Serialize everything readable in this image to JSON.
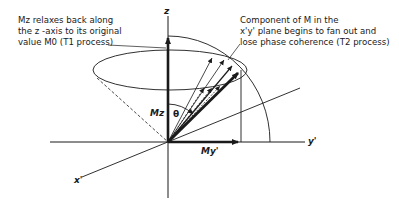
{
  "annotations": {
    "t1_note": {
      "line1": "Mz relaxes back along",
      "line2": "the z -axis to its original",
      "line3": "value M0 (T1 process)"
    },
    "t2_note": {
      "line1": "Component of M in the",
      "line2": "x'y' plane begins to fan out and",
      "line3": "lose phase coherence (T2 process)"
    }
  },
  "axes": {
    "z": "z",
    "x": "x'",
    "y": "y'"
  },
  "labels": {
    "mz": "Mz",
    "my": "My'",
    "theta": "θ"
  },
  "colors": {
    "ink": "#1a1a1a",
    "background": "#ffffff"
  }
}
